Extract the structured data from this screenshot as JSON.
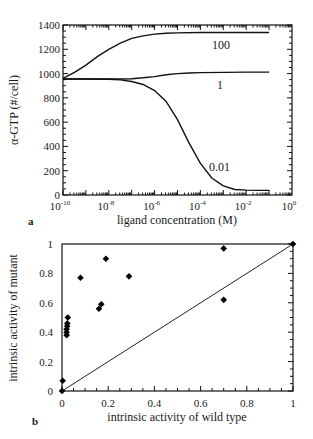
{
  "chart_data": [
    {
      "panel": "a",
      "type": "line",
      "title": "",
      "xlabel": "ligand concentration (M)",
      "ylabel": "α-GTP (#/cell)",
      "xscale": "log",
      "xlim": [
        1e-10,
        1
      ],
      "ylim": [
        0,
        1400
      ],
      "x_ticks": [
        {
          "value": 1e-10,
          "base": "10",
          "exp": "-10"
        },
        {
          "value": 1e-08,
          "base": "10",
          "exp": "-8"
        },
        {
          "value": 1e-06,
          "base": "10",
          "exp": "-6"
        },
        {
          "value": 0.0001,
          "base": "10",
          "exp": "-4"
        },
        {
          "value": 0.01,
          "base": "10",
          "exp": "-2"
        },
        {
          "value": 1,
          "base": "10",
          "exp": "0"
        }
      ],
      "y_ticks": [
        0,
        200,
        400,
        600,
        800,
        1000,
        1200,
        1400
      ],
      "grid": false,
      "series": [
        {
          "name": "100",
          "label": "100",
          "log10_x": [
            -10,
            -9.5,
            -9,
            -8.5,
            -8,
            -7.5,
            -7,
            -6.5,
            -6,
            -5.5,
            -5,
            -4,
            -3,
            -2,
            -1
          ],
          "y": [
            960,
            1010,
            1070,
            1140,
            1200,
            1250,
            1290,
            1310,
            1325,
            1332,
            1335,
            1338,
            1338,
            1338,
            1338
          ]
        },
        {
          "name": "1",
          "label": "1",
          "log10_x": [
            -10,
            -9,
            -8,
            -7.5,
            -7,
            -6.5,
            -6,
            -5.5,
            -5,
            -4.5,
            -4,
            -3,
            -2,
            -1
          ],
          "y": [
            955,
            955,
            955,
            955,
            958,
            965,
            975,
            990,
            1000,
            1005,
            1008,
            1010,
            1012,
            1012
          ]
        },
        {
          "name": "0.01",
          "label": "0.01",
          "log10_x": [
            -10,
            -9,
            -8,
            -7.5,
            -7,
            -6.5,
            -6,
            -5.5,
            -5,
            -4.5,
            -4,
            -3.5,
            -3,
            -2.5,
            -2,
            -1.5,
            -1
          ],
          "y": [
            955,
            955,
            953,
            948,
            935,
            910,
            860,
            770,
            620,
            430,
            260,
            140,
            75,
            45,
            40,
            38,
            38
          ]
        }
      ]
    },
    {
      "panel": "b",
      "type": "scatter",
      "title": "",
      "xlabel": "intrinsic activity of wild type",
      "ylabel": "intrinsic activity of mutant",
      "xlim": [
        0,
        1
      ],
      "ylim": [
        0,
        1
      ],
      "x_ticks": [
        "0",
        "0.2",
        "0.4",
        "0.6",
        "0.8",
        "1"
      ],
      "y_ticks": [
        "0",
        "0.2",
        "0.4",
        "0.6",
        "0.8",
        "1"
      ],
      "x_tick_values": [
        0,
        0.2,
        0.4,
        0.6,
        0.8,
        1
      ],
      "y_tick_values": [
        0,
        0.2,
        0.4,
        0.6,
        0.8,
        1
      ],
      "grid": false,
      "reference_line": {
        "label": "y = x",
        "from": [
          0,
          0
        ],
        "to": [
          1,
          1
        ]
      },
      "points": [
        {
          "x": 0.0,
          "y": 0.0
        },
        {
          "x": 0.003,
          "y": 0.07
        },
        {
          "x": 0.02,
          "y": 0.38
        },
        {
          "x": 0.02,
          "y": 0.4
        },
        {
          "x": 0.02,
          "y": 0.42
        },
        {
          "x": 0.022,
          "y": 0.44
        },
        {
          "x": 0.023,
          "y": 0.46
        },
        {
          "x": 0.025,
          "y": 0.5
        },
        {
          "x": 0.08,
          "y": 0.77
        },
        {
          "x": 0.16,
          "y": 0.56
        },
        {
          "x": 0.17,
          "y": 0.59
        },
        {
          "x": 0.19,
          "y": 0.9
        },
        {
          "x": 0.29,
          "y": 0.78
        },
        {
          "x": 0.7,
          "y": 0.97
        },
        {
          "x": 0.7,
          "y": 0.62
        },
        {
          "x": 1.0,
          "y": 1.0
        }
      ]
    }
  ],
  "panel_labels": {
    "a": "a",
    "b": "b"
  }
}
